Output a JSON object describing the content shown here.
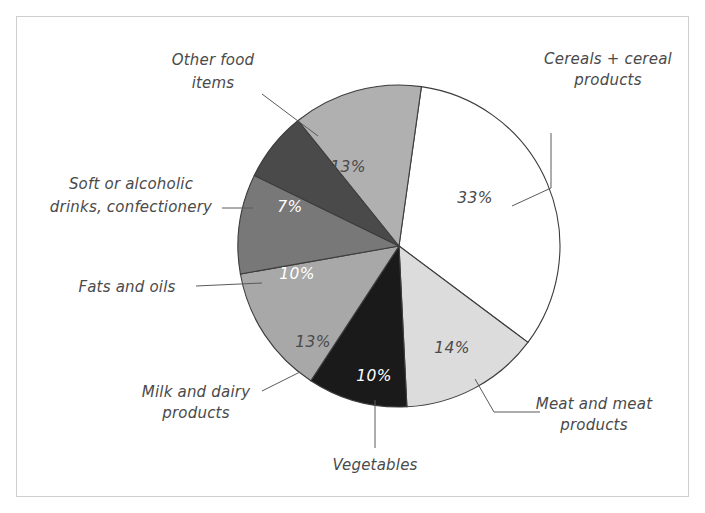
{
  "figure": {
    "border_color": "#cfcfcf",
    "background": "#ffffff"
  },
  "chart_data": {
    "type": "pie",
    "title": "",
    "subtitle": "",
    "xlabel": "",
    "ylabel": "",
    "legend_position": "none",
    "grid": false,
    "units": "percent",
    "total": 100,
    "categories": [
      "Cereals + cereal products",
      "Meat and meat products",
      "Vegetables",
      "Milk and dairy products",
      "Fats and oils",
      "Soft or alcoholic drinks, confectionery",
      "Other food items"
    ],
    "values": [
      33,
      14,
      10,
      13,
      10,
      7,
      13
    ],
    "value_labels": [
      "33%",
      "14%",
      "10%",
      "13%",
      "10%",
      "7%",
      "13%"
    ],
    "colors": [
      "#ffffff",
      "#dcdcdc",
      "#1a1a1a",
      "#a8a8a8",
      "#787878",
      "#4a4a4a",
      "#b0b0b0"
    ],
    "label_text_colors": [
      "#4a4a4a",
      "#4a4a4a",
      "#ffffff",
      "#4a4a4a",
      "#ffffff",
      "#ffffff",
      "#4a4a4a"
    ],
    "slices": [
      {
        "name": "Cereals + cereal products",
        "value": 33,
        "value_label": "33%",
        "color": "#ffffff",
        "text_color": "#4a4a4a",
        "label": "Cereals + cereal products",
        "label_lines": [
          "Cereals + cereal",
          "products"
        ]
      },
      {
        "name": "Meat and meat products",
        "value": 14,
        "value_label": "14%",
        "color": "#dcdcdc",
        "text_color": "#4a4a4a",
        "label": "Meat and meat products",
        "label_lines": [
          "Meat and meat",
          "products"
        ]
      },
      {
        "name": "Vegetables",
        "value": 10,
        "value_label": "10%",
        "color": "#1a1a1a",
        "text_color": "#ffffff",
        "label": "Vegetables",
        "label_lines": [
          "Vegetables"
        ]
      },
      {
        "name": "Milk and dairy products",
        "value": 13,
        "value_label": "13%",
        "color": "#a8a8a8",
        "text_color": "#4a4a4a",
        "label": "Milk and dairy products",
        "label_lines": [
          "Milk and dairy",
          "products"
        ]
      },
      {
        "name": "Fats and oils",
        "value": 10,
        "value_label": "10%",
        "color": "#787878",
        "text_color": "#ffffff",
        "label": "Fats and oils",
        "label_lines": [
          "Fats and oils"
        ]
      },
      {
        "name": "Soft or alcoholic drinks, confectionery",
        "value": 7,
        "value_label": "7%",
        "color": "#4a4a4a",
        "text_color": "#ffffff",
        "label": "Soft or alcoholic drinks, confectionery",
        "label_lines": [
          "Soft or alcoholic",
          "drinks, confectionery"
        ]
      },
      {
        "name": "Other food items",
        "value": 13,
        "value_label": "13%",
        "color": "#b0b0b0",
        "text_color": "#4a4a4a",
        "label": "Other food items",
        "label_lines": [
          "Other food",
          "items"
        ]
      }
    ]
  },
  "labels": {
    "cereals_line1": "Cereals + cereal",
    "cereals_line2": "products",
    "meat_line1": "Meat and meat",
    "meat_line2": "products",
    "vegetables_line1": "Vegetables",
    "milk_line1": "Milk and dairy",
    "milk_line2": "products",
    "fats_line1": "Fats and oils",
    "drinks_line1": "Soft or alcoholic",
    "drinks_line2": "drinks, confectionery",
    "other_line1": "Other food",
    "other_line2": "items"
  },
  "percent_labels": {
    "cereals": "33%",
    "meat": "14%",
    "vegetables": "10%",
    "milk": "13%",
    "fats": "10%",
    "drinks": "7%",
    "other": "13%"
  }
}
